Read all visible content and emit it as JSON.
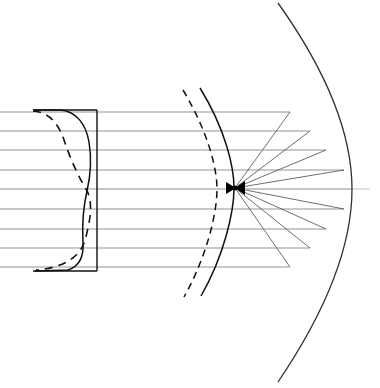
{
  "figure": {
    "type": "optical-ray-diagram",
    "system_name": "Schmidt camera",
    "width": 380,
    "height": 388,
    "background_color": "#ffffff",
    "line_color": "#111111",
    "ray_color": "#6b6b6b",
    "axis_color": "#bdbdbd"
  },
  "optical_axis": {
    "label": "optical axis",
    "y": 189,
    "x_start": 0,
    "x_end": 380,
    "style": "dashed",
    "color": "#c2c2c2",
    "dash_pattern": "34 14"
  },
  "corrector_plate": {
    "label": "aspheric corrector plate",
    "x_left": 30,
    "x_right": 97,
    "y_top": 110,
    "y_bottom": 271,
    "frame_color": "#111111",
    "solid_profile_label": "corrector figured surface",
    "dashed_profile_label": "alternate corrector profile",
    "profile_solid_path": "M 33 110 L 60 110 C 76 111 86 124 89 142 C 92 160 90 178 87 191 C 84 204 82 224 83 242 C 84 256 80 266 68 270 L 35 271",
    "profile_dashed_path": "M 33 111 C 48 112 58 122 64 140 C 70 158 78 176 86 189 C 94 202 90 222 85 240 C 80 258 62 268 36 270"
  },
  "focal_surface": {
    "label": "curved focal surface",
    "style": "solid",
    "path": "M 200 88 C 226 130 234 168 234 188 C 234 212 224 256 201 296",
    "color": "#111111"
  },
  "field_flattener_arc": {
    "label": "field stop arc",
    "style": "dashed",
    "path": "M 183 90 C 208 132 217 168 217 189 C 217 213 207 256 184 297",
    "color": "#111111",
    "dash_pattern": "7 5"
  },
  "primary_mirror": {
    "label": "spherical primary mirror",
    "style": "solid",
    "path": "M 278 3 C 320 62 352 128 352 189 C 352 252 320 320 278 382",
    "vertex_x": 352,
    "vertex_y": 189,
    "color": "#333333"
  },
  "focus_point": {
    "label": "focal point",
    "x": 235,
    "y": 188
  },
  "incoming_rays": {
    "label": "incident parallel rays",
    "x_start": 0,
    "color": "#808080",
    "items": [
      {
        "name": "ray-1",
        "y_in": 112,
        "y_mirror": 112,
        "x_mirror": 290
      },
      {
        "name": "ray-2",
        "y_in": 131,
        "y_mirror": 131,
        "x_mirror": 310
      },
      {
        "name": "ray-3",
        "y_in": 150,
        "y_mirror": 150,
        "x_mirror": 326
      },
      {
        "name": "ray-4",
        "y_in": 170,
        "y_mirror": 170,
        "x_mirror": 344
      },
      {
        "name": "ray-5",
        "y_in": 189,
        "y_mirror": 189,
        "x_mirror": 352
      },
      {
        "name": "ray-6",
        "y_in": 209,
        "y_mirror": 209,
        "x_mirror": 344
      },
      {
        "name": "ray-7",
        "y_in": 229,
        "y_mirror": 229,
        "x_mirror": 326
      },
      {
        "name": "ray-8",
        "y_in": 248,
        "y_mirror": 248,
        "x_mirror": 310
      },
      {
        "name": "ray-9",
        "y_in": 267,
        "y_mirror": 267,
        "x_mirror": 290
      }
    ]
  },
  "reflected_rays": {
    "label": "converging reflected rays",
    "color": "#555555",
    "converge_x": 235,
    "converge_y": 188,
    "items": [
      {
        "name": "reflected-ray-1",
        "x_mirror": 290,
        "y_mirror": 112
      },
      {
        "name": "reflected-ray-2",
        "x_mirror": 310,
        "y_mirror": 131
      },
      {
        "name": "reflected-ray-3",
        "x_mirror": 326,
        "y_mirror": 150
      },
      {
        "name": "reflected-ray-4",
        "x_mirror": 344,
        "y_mirror": 170
      },
      {
        "name": "reflected-ray-5",
        "x_mirror": 352,
        "y_mirror": 189
      },
      {
        "name": "reflected-ray-6",
        "x_mirror": 344,
        "y_mirror": 209
      },
      {
        "name": "reflected-ray-7",
        "x_mirror": 326,
        "y_mirror": 229
      },
      {
        "name": "reflected-ray-8",
        "x_mirror": 310,
        "y_mirror": 248
      },
      {
        "name": "reflected-ray-9",
        "x_mirror": 290,
        "y_mirror": 267
      }
    ]
  },
  "chart_data": {
    "type": "line",
    "title": "",
    "xlabel": "",
    "ylabel": "",
    "series": [
      {
        "name": "incident parallel rays",
        "x": [
          0,
          0,
          0,
          0,
          0,
          0,
          0,
          0,
          0
        ],
        "values": [
          112,
          131,
          150,
          170,
          189,
          209,
          229,
          248,
          267
        ]
      },
      {
        "name": "mirror intercept points",
        "x": [
          290,
          310,
          326,
          344,
          352,
          344,
          326,
          310,
          290
        ],
        "values": [
          112,
          131,
          150,
          170,
          189,
          209,
          229,
          248,
          267
        ]
      },
      {
        "name": "focal point",
        "x": [
          235
        ],
        "values": [
          188
        ]
      }
    ]
  }
}
